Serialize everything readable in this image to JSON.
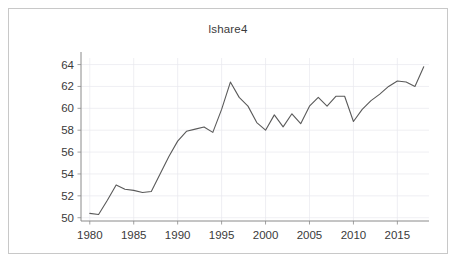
{
  "figure": {
    "border_color": "#c8c8c8",
    "background": "#ffffff"
  },
  "chart_data": {
    "type": "line",
    "title": "lshare4",
    "xlabel": "",
    "ylabel": "",
    "xlim": [
      1979.0,
      2018.6
    ],
    "ylim": [
      49.7,
      64.6
    ],
    "grid": true,
    "legend": false,
    "line_color": "#5a5a5a",
    "y_ticks": [
      50,
      52,
      54,
      56,
      58,
      60,
      62,
      64
    ],
    "y_tick_labels": [
      "50",
      "52",
      "54",
      "56",
      "58",
      "60",
      "62",
      "64"
    ],
    "x_ticks": [
      1980,
      1985,
      1990,
      1995,
      2000,
      2005,
      2010,
      2015
    ],
    "x_tick_labels": [
      "1980",
      "1985",
      "1990",
      "1995",
      "2000",
      "2005",
      "2010",
      "2015"
    ],
    "x": [
      1980,
      1981,
      1982,
      1983,
      1984,
      1985,
      1986,
      1987,
      1988,
      1989,
      1990,
      1991,
      1992,
      1993,
      1994,
      1995,
      1996,
      1997,
      1998,
      1999,
      2000,
      2001,
      2002,
      2003,
      2004,
      2005,
      2006,
      2007,
      2008,
      2009,
      2010,
      2011,
      2012,
      2013,
      2014,
      2015,
      2016,
      2017,
      2018
    ],
    "values": [
      50.4,
      50.3,
      51.6,
      53.0,
      52.6,
      52.5,
      52.3,
      52.4,
      54.0,
      55.6,
      57.0,
      57.9,
      58.1,
      58.3,
      57.8,
      59.9,
      62.4,
      61.0,
      60.2,
      58.7,
      58.0,
      59.4,
      58.3,
      59.5,
      58.6,
      60.2,
      61.0,
      60.2,
      61.1,
      61.1,
      58.8,
      59.9,
      60.7,
      61.3,
      62.0,
      62.5,
      62.4,
      62.0,
      63.8
    ],
    "series_name": "lshare4"
  }
}
